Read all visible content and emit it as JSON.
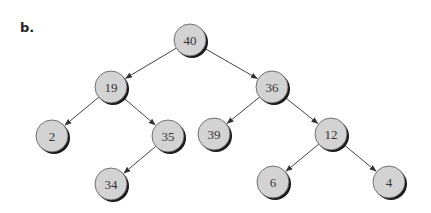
{
  "figure": {
    "label": "b."
  },
  "tree": {
    "nodes": [
      {
        "id": "n40",
        "value": "40",
        "x": 190,
        "y": 40
      },
      {
        "id": "n19",
        "value": "19",
        "x": 111,
        "y": 87
      },
      {
        "id": "n36",
        "value": "36",
        "x": 272,
        "y": 87
      },
      {
        "id": "n2",
        "value": "2",
        "x": 52,
        "y": 136
      },
      {
        "id": "n35",
        "value": "35",
        "x": 168,
        "y": 136
      },
      {
        "id": "n39",
        "value": "39",
        "x": 214,
        "y": 134
      },
      {
        "id": "n12",
        "value": "12",
        "x": 331,
        "y": 134
      },
      {
        "id": "n34",
        "value": "34",
        "x": 111,
        "y": 184
      },
      {
        "id": "n6",
        "value": "6",
        "x": 273,
        "y": 182
      },
      {
        "id": "n4",
        "value": "4",
        "x": 389,
        "y": 182
      }
    ],
    "edges": [
      [
        "n40",
        "n19"
      ],
      [
        "n40",
        "n36"
      ],
      [
        "n19",
        "n2"
      ],
      [
        "n19",
        "n35"
      ],
      [
        "n35",
        "n34"
      ],
      [
        "n36",
        "n39"
      ],
      [
        "n36",
        "n12"
      ],
      [
        "n12",
        "n6"
      ],
      [
        "n12",
        "n4"
      ]
    ],
    "node_fill": "#d3d3d3",
    "node_stroke": "#555555",
    "shadow_color": "#1a1a1a",
    "edge_color": "#444444"
  }
}
